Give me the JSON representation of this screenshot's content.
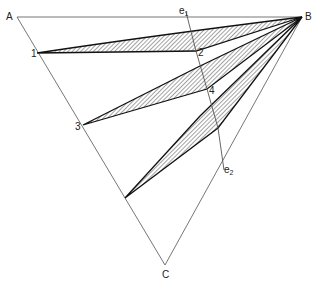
{
  "diagram": {
    "type": "ternary-tie-line-diagram",
    "vertices": {
      "A": {
        "label": "A",
        "x": 17,
        "y": 17
      },
      "B": {
        "label": "B",
        "x": 302,
        "y": 17
      },
      "C": {
        "label": "C",
        "x": 165,
        "y": 265
      }
    },
    "points": [
      {
        "label": "1",
        "x": 37,
        "y": 53
      },
      {
        "label": "2",
        "x": 196,
        "y": 51
      },
      {
        "label": "3",
        "x": 83,
        "y": 125
      },
      {
        "label": "4",
        "x": 207,
        "y": 89
      }
    ],
    "boundary_line": {
      "start_label": "e",
      "start_sub": "1",
      "end_label": "e",
      "end_sub": "2",
      "path": [
        [
          186,
          12
        ],
        [
          196,
          51
        ],
        [
          207,
          89
        ],
        [
          218,
          128
        ],
        [
          224,
          170
        ]
      ]
    },
    "wedges": [
      {
        "name": "wedge-1-2",
        "polygon": [
          [
            37,
            53
          ],
          [
            302,
            17
          ],
          [
            196,
            51
          ]
        ],
        "upper": [
          [
            37,
            53
          ],
          [
            120,
            41
          ],
          [
            302,
            17
          ]
        ]
      },
      {
        "name": "wedge-3-4",
        "polygon": [
          [
            83,
            125
          ],
          [
            302,
            17
          ],
          [
            207,
            89
          ]
        ],
        "upper": [
          [
            83,
            125
          ],
          [
            198,
            67
          ],
          [
            302,
            17
          ]
        ]
      },
      {
        "name": "wedge-bottom",
        "polygon": [
          [
            125,
            198
          ],
          [
            302,
            17
          ],
          [
            218,
            128
          ]
        ],
        "upper": [
          [
            125,
            198
          ],
          [
            200,
            115
          ],
          [
            302,
            17
          ]
        ]
      }
    ],
    "hatch_color": "#222222",
    "line_color": "#555555"
  }
}
